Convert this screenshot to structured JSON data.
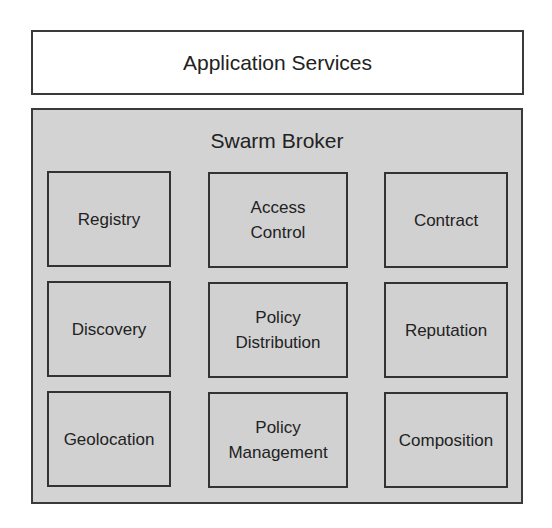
{
  "diagram": {
    "top_layer": {
      "label": "Application Services"
    },
    "broker": {
      "title": "Swarm Broker",
      "fill_color": "#d3d3d3",
      "border_color": "#3a3a3a",
      "modules": [
        {
          "label": "Registry",
          "row": 0,
          "col": 0
        },
        {
          "label": "Access\nControl",
          "row": 0,
          "col": 1
        },
        {
          "label": "Contract",
          "row": 0,
          "col": 2
        },
        {
          "label": "Discovery",
          "row": 1,
          "col": 0
        },
        {
          "label": "Policy\nDistribution",
          "row": 1,
          "col": 1
        },
        {
          "label": "Reputation",
          "row": 1,
          "col": 2
        },
        {
          "label": "Geolocation",
          "row": 2,
          "col": 0
        },
        {
          "label": "Policy\nManagement",
          "row": 2,
          "col": 1
        },
        {
          "label": "Composition",
          "row": 2,
          "col": 2
        }
      ]
    }
  }
}
